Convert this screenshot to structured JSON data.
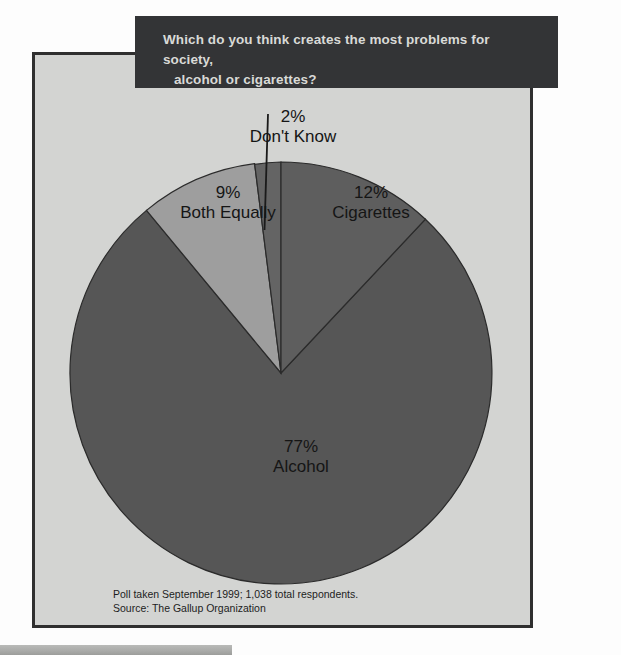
{
  "title": {
    "line1": "Which do you think creates the most problems for society,",
    "line2": "alcohol or cigarettes?"
  },
  "footnote": {
    "line1": "Poll taken September 1999; 1,038 total respondents.",
    "line2": "Source: The Gallup Organization"
  },
  "labels": {
    "dontknow": {
      "pct": "2%",
      "name": "Don't Know"
    },
    "both": {
      "pct": "9%",
      "name": "Both Equally"
    },
    "cigs": {
      "pct": "12%",
      "name": "Cigarettes"
    },
    "alcohol": {
      "pct": "77%",
      "name": "Alcohol"
    }
  },
  "colors": {
    "page_background": "#fdfdfd",
    "panel_background": "#d3d4d2",
    "panel_border": "#2f2f2f",
    "title_bar": "#333436",
    "title_text": "#d9dad7",
    "alcohol": "#565656",
    "cigarettes": "#5e5e5e",
    "both_equally": "#9e9e9e",
    "dont_know": "#646464",
    "wedge_outline": "#2b2b2b",
    "leader_line": "#1a1a1a",
    "label_text": "#151515",
    "bottom_bar": "#aeafad"
  },
  "chart_data": {
    "type": "pie",
    "title": "Which do you think creates the most problems for society, alcohol or cigarettes?",
    "xlabel": "",
    "ylabel": "",
    "grid": false,
    "legend": "none",
    "labels_inline": true,
    "total_respondents": "1,038",
    "poll_date": "September 1999",
    "source": "The Gallup Organization",
    "units": "percent",
    "start_angle_deg": 0,
    "direction": "clockwise",
    "categories": [
      "Cigarettes",
      "Alcohol",
      "Both Equally",
      "Don't Know"
    ],
    "values": [
      12,
      77,
      9,
      2
    ],
    "slices": [
      {
        "label": "Cigarettes",
        "value": 12,
        "display": "12%",
        "color": "#5e5e5e"
      },
      {
        "label": "Alcohol",
        "value": 77,
        "display": "77%",
        "color": "#565656"
      },
      {
        "label": "Both Equally",
        "value": 9,
        "display": "9%",
        "color": "#9e9e9e"
      },
      {
        "label": "Don't Know",
        "value": 2,
        "display": "2%",
        "color": "#646464"
      }
    ]
  }
}
